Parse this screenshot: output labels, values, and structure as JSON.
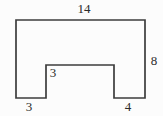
{
  "diagram": {
    "type": "composite-shape-rectangle-with-bottom-notch",
    "polygon_points": "16,20 145,20 145,98 114,98 114,65 46,65 46,98 16,98",
    "labels": {
      "top_width": "14",
      "right_height": "8",
      "notch_height": "3",
      "bottom_left_width": "3",
      "bottom_right_width": "4"
    },
    "colors": {
      "stroke": "#3c3c3c",
      "text": "#2b2b2b",
      "background": "#fcfcfc"
    }
  }
}
